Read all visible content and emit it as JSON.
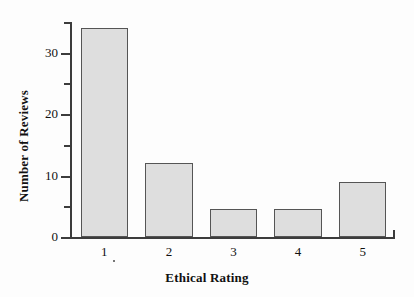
{
  "chart_data": {
    "type": "bar",
    "title": "",
    "subtitle": "",
    "xlabel": "Ethical Rating",
    "ylabel": "Number of Reviews",
    "categories": [
      "1",
      "2",
      "3",
      "4",
      "5"
    ],
    "values": [
      34,
      12,
      4.5,
      4.5,
      9
    ],
    "series": [
      {
        "name": "Number of Reviews",
        "values": [
          34,
          12,
          4.5,
          4.5,
          9
        ]
      }
    ],
    "ylim": [
      0,
      35
    ],
    "xlim_categories": 5,
    "y_major_ticks": [
      0,
      10,
      20,
      30
    ],
    "y_major_tick_labels": [
      "0",
      "10",
      "20",
      "30"
    ],
    "y_minor_ticks": [
      5,
      15,
      25,
      35
    ],
    "grid": false,
    "legend": false,
    "legend_position": "none",
    "bar_fill_color": "#dedede",
    "bar_edge_color": "#555555",
    "axis_color": "#3c3c3c",
    "background_color": "#fdfdfd",
    "text_color": "#111111",
    "annotations": []
  }
}
